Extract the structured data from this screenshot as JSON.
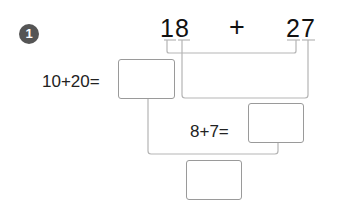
{
  "problem": {
    "number": "1",
    "operand_a": "18",
    "operator": "+",
    "operand_b": "27",
    "step_tens": "10+20=",
    "step_ones": "8+7=",
    "answer_boxes": {
      "tens_result": "",
      "ones_result": "",
      "final_result": ""
    }
  },
  "colors": {
    "badge": "#555555",
    "line": "#b0b0b0",
    "box_border": "#9a9a9a"
  }
}
